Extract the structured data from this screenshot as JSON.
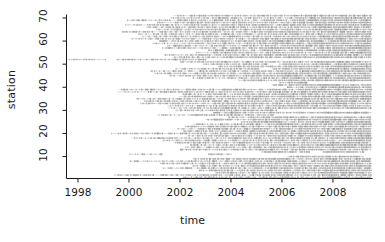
{
  "chart_data": {
    "type": "scatter",
    "title": "",
    "xlabel": "time",
    "ylabel": "station",
    "xlim": [
      1997.55,
      2009.55
    ],
    "ylim": [
      0.5,
      71.5
    ],
    "grid": false,
    "legend": null,
    "xticks": [
      1998,
      2000,
      2002,
      2004,
      2006,
      2008
    ],
    "yticks": [
      10,
      20,
      30,
      40,
      50,
      60,
      70
    ],
    "point_color": "#8c8c8c",
    "axis_color": "#1a1a1a",
    "series": [
      {
        "station": 71,
        "segments": [
          [
            2001.75,
            2009.5
          ]
        ]
      },
      {
        "station": 70,
        "segments": [
          [
            2001.6,
            2009.5
          ]
        ]
      },
      {
        "station": 69,
        "segments": [
          [
            1999.9,
            2009.5
          ]
        ]
      },
      {
        "station": 68,
        "segments": [
          [
            2001.1,
            2009.5
          ]
        ]
      },
      {
        "station": 67,
        "segments": [
          [
            1999.85,
            2009.5
          ]
        ]
      },
      {
        "station": 66,
        "segments": [
          [
            2000.7,
            2009.5
          ]
        ]
      },
      {
        "station": 65,
        "segments": [
          [
            2001.05,
            2009.5
          ]
        ]
      },
      {
        "station": 64,
        "segments": [
          [
            1999.7,
            2009.5
          ]
        ]
      },
      {
        "station": 63,
        "segments": [
          [
            2000.35,
            2009.5
          ]
        ]
      },
      {
        "station": 62,
        "segments": [
          [
            2000.5,
            2009.5
          ]
        ]
      },
      {
        "station": 61,
        "segments": [
          [
            2000.1,
            2009.5
          ]
        ]
      },
      {
        "station": 60,
        "segments": [
          [
            2001.2,
            2009.5
          ]
        ]
      },
      {
        "station": 59,
        "segments": [
          [
            2000.9,
            2009.5
          ]
        ]
      },
      {
        "station": 58,
        "segments": [
          [
            2001.5,
            2009.5
          ]
        ]
      },
      {
        "station": 57,
        "segments": [
          [
            2001.3,
            2009.5
          ]
        ]
      },
      {
        "station": 56,
        "segments": [
          [
            2003.1,
            2009.5
          ]
        ]
      },
      {
        "station": 55,
        "segments": [
          [
            2002.6,
            2009.5
          ]
        ]
      },
      {
        "station": 54,
        "segments": [
          [
            2001.4,
            2009.5
          ]
        ]
      },
      {
        "station": 53,
        "segments": [
          [
            2001.7,
            2009.5
          ]
        ]
      },
      {
        "station": 52,
        "segments": [
          [
            1997.6,
            1999.1
          ],
          [
            1999.5,
            2003.0
          ]
        ]
      },
      {
        "station": 51,
        "segments": [
          [
            2002.0,
            2009.5
          ]
        ]
      },
      {
        "station": 50,
        "segments": [
          [
            2002.9,
            2005.4
          ],
          [
            2005.9,
            2009.5
          ]
        ]
      },
      {
        "station": 49,
        "segments": [
          [
            2003.5,
            2009.5
          ]
        ]
      },
      {
        "station": 48,
        "segments": [
          [
            2001.8,
            2005.1
          ],
          [
            2005.6,
            2009.5
          ]
        ]
      },
      {
        "station": 47,
        "segments": [
          [
            2000.85,
            2009.5
          ]
        ]
      },
      {
        "station": 46,
        "segments": [
          [
            2001.0,
            2009.5
          ]
        ]
      },
      {
        "station": 45,
        "segments": [
          [
            2001.6,
            2009.5
          ]
        ]
      },
      {
        "station": 44,
        "segments": [
          [
            2002.5,
            2009.5
          ]
        ]
      },
      {
        "station": 43,
        "segments": [
          [
            2004.3,
            2009.5
          ]
        ]
      },
      {
        "station": 42,
        "segments": [
          [
            2005.9,
            2007.0
          ]
        ]
      },
      {
        "station": 41,
        "segments": [
          [
            2005.6,
            2009.5
          ]
        ]
      },
      {
        "station": 40,
        "segments": [
          [
            2006.2,
            2009.5
          ]
        ]
      },
      {
        "station": 39,
        "segments": [
          [
            1999.6,
            2009.5
          ]
        ]
      },
      {
        "station": 38,
        "segments": [
          [
            1999.55,
            2009.5
          ]
        ]
      },
      {
        "station": 37,
        "segments": [
          [
            2002.1,
            2009.5
          ]
        ]
      },
      {
        "station": 36,
        "segments": [
          [
            2001.95,
            2009.5
          ]
        ]
      },
      {
        "station": 35,
        "segments": [
          [
            2000.3,
            2009.5
          ]
        ]
      },
      {
        "station": 34,
        "segments": [
          [
            2000.6,
            2009.5
          ]
        ]
      },
      {
        "station": 33,
        "segments": [
          [
            2000.45,
            2009.5
          ]
        ]
      },
      {
        "station": 32,
        "segments": [
          [
            2001.5,
            2009.5
          ]
        ]
      },
      {
        "station": 31,
        "segments": [
          [
            2001.55,
            2009.5
          ]
        ]
      },
      {
        "station": 30,
        "segments": [
          [
            2001.8,
            2005.8
          ]
        ]
      },
      {
        "station": 29,
        "segments": [
          [
            2003.3,
            2009.5
          ]
        ]
      },
      {
        "station": 28,
        "segments": [
          [
            2001.1,
            2005.7
          ]
        ]
      },
      {
        "station": 27,
        "segments": [
          [
            2003.9,
            2009.5
          ]
        ]
      },
      {
        "station": 26,
        "segments": [
          [
            2003.0,
            2009.5
          ]
        ]
      },
      {
        "station": 25,
        "segments": [
          [
            2004.4,
            2009.5
          ]
        ]
      },
      {
        "station": 24,
        "segments": [
          [
            2002.5,
            2009.5
          ]
        ]
      },
      {
        "station": 23,
        "segments": [
          [
            2002.2,
            2009.5
          ]
        ]
      },
      {
        "station": 22,
        "segments": [
          [
            2001.9,
            2009.5
          ]
        ]
      },
      {
        "station": 21,
        "segments": [
          [
            2002.1,
            2009.5
          ]
        ]
      },
      {
        "station": 20,
        "segments": [
          [
            1999.3,
            2009.5
          ]
        ]
      },
      {
        "station": 19,
        "segments": [
          [
            2002.3,
            2009.5
          ]
        ]
      },
      {
        "station": 18,
        "segments": [
          [
            2000.1,
            2009.5
          ]
        ]
      },
      {
        "station": 17,
        "segments": [
          [
            2001.3,
            2009.5
          ]
        ]
      },
      {
        "station": 16,
        "segments": [
          [
            2001.75,
            2009.5
          ]
        ]
      },
      {
        "station": 15,
        "segments": [
          [
            2002.4,
            2009.5
          ]
        ]
      },
      {
        "station": 14,
        "segments": [
          [
            2002.2,
            2009.5
          ]
        ]
      },
      {
        "station": 13,
        "segments": [
          [
            2002.0,
            2009.5
          ]
        ]
      },
      {
        "station": 12,
        "segments": [
          [
            2005.2,
            2007.1
          ],
          [
            2007.6,
            2009.2
          ]
        ]
      },
      {
        "station": 11,
        "segments": [
          [
            2000.0,
            2001.3
          ],
          [
            2003.1,
            2004.0
          ]
        ]
      },
      {
        "station": 10,
        "segments": [
          [
            2006.2,
            2009.2
          ]
        ]
      },
      {
        "station": 9,
        "segments": [
          [
            2002.5,
            2009.5
          ]
        ]
      },
      {
        "station": 8,
        "segments": [
          [
            2000.0,
            2009.5
          ]
        ]
      },
      {
        "station": 7,
        "segments": [
          [
            2001.2,
            2009.5
          ]
        ]
      },
      {
        "station": 6,
        "segments": [
          [
            2002.5,
            2009.5
          ]
        ]
      },
      {
        "station": 5,
        "segments": [
          [
            2001.3,
            2009.5
          ]
        ]
      },
      {
        "station": 4,
        "segments": [
          [
            2002.75,
            2009.5
          ]
        ]
      },
      {
        "station": 3,
        "segments": [
          [
            2003.4,
            2009.5
          ]
        ]
      },
      {
        "station": 2,
        "segments": [
          [
            1999.4,
            2009.5
          ]
        ]
      },
      {
        "station": 1,
        "segments": [
          [
            2002.1,
            2009.5
          ]
        ]
      }
    ]
  }
}
